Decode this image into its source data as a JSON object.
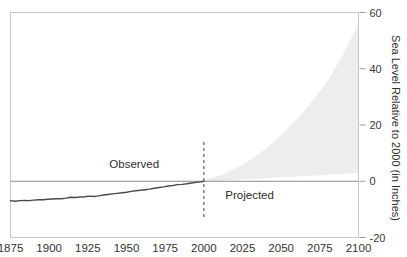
{
  "chart_data": {
    "type": "area",
    "title": "",
    "xlabel": "",
    "ylabel": "Sea Level Relative to 2000 (in Inches)",
    "xlim": [
      1875,
      2100
    ],
    "ylim": [
      -20,
      60
    ],
    "grid": false,
    "legend_position": "none",
    "xticks": [
      1875,
      1900,
      1925,
      1950,
      1975,
      2000,
      2025,
      2050,
      2075,
      2100
    ],
    "yticks": [
      -20,
      0,
      20,
      40,
      60
    ],
    "annotations": [
      {
        "text": "Observed",
        "x": 1975,
        "y": 6,
        "align": "end"
      },
      {
        "text": "Projected",
        "x": 2010,
        "y": -5,
        "align": "start"
      }
    ],
    "divider": {
      "x": 2000,
      "style": "dashed",
      "color": "#6b6b6b"
    },
    "zero_line": {
      "y": 0,
      "color": "#8c8c8c"
    },
    "colors": {
      "observed_line": "#4a4a4a",
      "projection_band": "#ededed",
      "plot_border": "#c8c8c8",
      "zero_line": "#8c8c8c",
      "divider": "#6b6b6b",
      "tick_text": "#333333"
    },
    "series": [
      {
        "name": "Observed",
        "type": "line",
        "x": [
          1875,
          1878,
          1881,
          1884,
          1887,
          1890,
          1893,
          1896,
          1899,
          1902,
          1905,
          1908,
          1911,
          1914,
          1917,
          1920,
          1923,
          1926,
          1929,
          1932,
          1935,
          1938,
          1941,
          1944,
          1947,
          1950,
          1953,
          1956,
          1959,
          1962,
          1965,
          1968,
          1971,
          1974,
          1977,
          1980,
          1983,
          1986,
          1989,
          1992,
          1995,
          1998,
          2000
        ],
        "values": [
          -6.9,
          -7.1,
          -6.9,
          -6.8,
          -6.9,
          -6.7,
          -6.6,
          -6.6,
          -6.4,
          -6.3,
          -6.2,
          -6.2,
          -6.0,
          -5.7,
          -5.8,
          -5.6,
          -5.5,
          -5.3,
          -5.4,
          -5.2,
          -4.9,
          -4.7,
          -4.5,
          -4.3,
          -4.1,
          -3.9,
          -3.6,
          -3.4,
          -3.2,
          -3.0,
          -2.8,
          -2.5,
          -2.2,
          -2.0,
          -1.7,
          -1.5,
          -1.2,
          -1.1,
          -0.9,
          -0.6,
          -0.4,
          -0.2,
          0.0
        ]
      },
      {
        "name": "Projected range",
        "type": "band",
        "x": [
          2000,
          2010,
          2020,
          2030,
          2040,
          2050,
          2060,
          2070,
          2080,
          2090,
          2100
        ],
        "lower": [
          0,
          0.2,
          0.5,
          0.8,
          1.1,
          1.4,
          1.7,
          2.0,
          2.3,
          2.6,
          3.0
        ],
        "upper": [
          0.4,
          2.0,
          4.4,
          7.6,
          11.6,
          16.4,
          22.0,
          28.4,
          35.6,
          45.0,
          56.0
        ]
      }
    ]
  }
}
